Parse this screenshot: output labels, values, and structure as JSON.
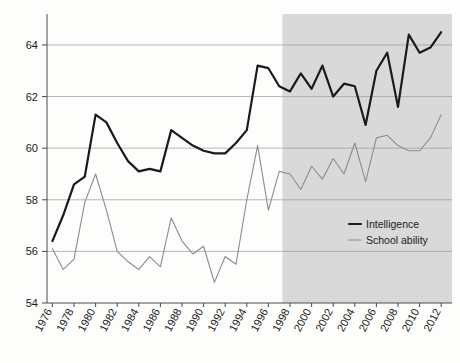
{
  "chart_data": {
    "type": "line",
    "title": "",
    "subtitle": "",
    "xlabel": "",
    "ylabel": "",
    "xlim": [
      1975.5,
      2013.0
    ],
    "ylim": [
      54.0,
      65.2
    ],
    "grid": true,
    "y_ticks": [
      54,
      56,
      58,
      60,
      62,
      64
    ],
    "x_ticks": [
      1976,
      1978,
      1980,
      1982,
      1984,
      1986,
      1988,
      1990,
      1992,
      1994,
      1996,
      1998,
      2000,
      2002,
      2004,
      2006,
      2008,
      2010,
      2012
    ],
    "x_tick_rotation": 62,
    "legend_position": "inside-right-middle",
    "shaded_region": {
      "x_start": 1997.3,
      "x_end": 2013.0,
      "color": "#d2d2d2",
      "label": ""
    },
    "x": [
      1976,
      1977,
      1978,
      1979,
      1980,
      1981,
      1982,
      1983,
      1984,
      1985,
      1986,
      1987,
      1988,
      1989,
      1990,
      1991,
      1992,
      1993,
      1994,
      1995,
      1996,
      1997,
      1998,
      1999,
      2000,
      2001,
      2002,
      2003,
      2004,
      2005,
      2006,
      2007,
      2008,
      2009,
      2010,
      2011,
      2012
    ],
    "series": [
      {
        "name": "Intelligence",
        "color": "#1a1a1a",
        "width": 2.2,
        "values": [
          56.4,
          57.4,
          58.6,
          58.9,
          61.3,
          61.0,
          60.2,
          59.5,
          59.1,
          59.2,
          59.1,
          60.7,
          60.4,
          60.1,
          59.9,
          59.8,
          59.8,
          60.2,
          60.7,
          63.2,
          63.1,
          62.4,
          62.2,
          62.9,
          62.3,
          63.2,
          62.0,
          62.5,
          62.4,
          60.9,
          63.0,
          63.7,
          61.6,
          64.4,
          63.7,
          63.9,
          64.5
        ]
      },
      {
        "name": "School ability",
        "color": "#8c8c8c",
        "width": 1.1,
        "values": [
          56.1,
          55.3,
          55.7,
          57.9,
          59.0,
          57.6,
          56.0,
          55.6,
          55.3,
          55.8,
          55.4,
          57.3,
          56.4,
          55.9,
          56.2,
          54.8,
          55.8,
          55.5,
          58.0,
          60.1,
          57.6,
          59.1,
          59.0,
          58.4,
          59.3,
          58.8,
          59.6,
          59.0,
          60.2,
          58.7,
          60.4,
          60.5,
          60.1,
          59.9,
          59.9,
          60.4,
          61.3
        ]
      }
    ]
  }
}
